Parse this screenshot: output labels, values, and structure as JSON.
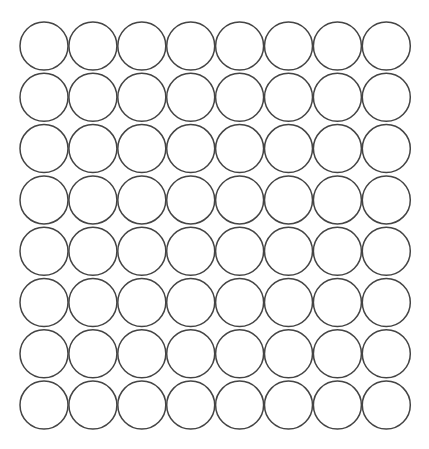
{
  "grid": {
    "rows": 8,
    "cols": 8,
    "origin_x": 44,
    "origin_y": 46,
    "pitch_x": 48.9,
    "pitch_y": 51.3,
    "radius": 24,
    "stroke_color": "#444444",
    "stroke_width": 1.5,
    "fill_color": "#ffffff",
    "background": "#ffffff"
  }
}
